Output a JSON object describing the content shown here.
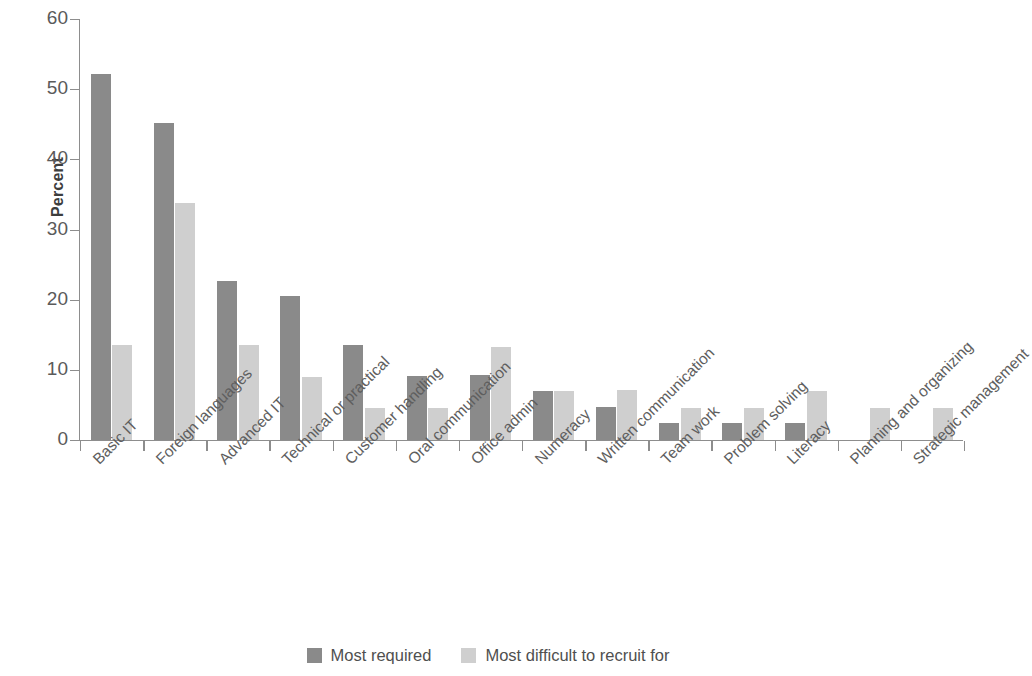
{
  "chart_data": {
    "type": "bar",
    "title": "",
    "subtitle": "",
    "xlabel": "",
    "ylabel": "Percent",
    "ylim": [
      0,
      60
    ],
    "yticks": [
      0,
      10,
      20,
      30,
      40,
      50,
      60
    ],
    "ytick_labels": [
      "0",
      "10",
      "20",
      "30",
      "40",
      "50",
      "60"
    ],
    "grid": false,
    "legend_position": "bottom-center",
    "orientation": "vertical",
    "bar_label_rotation": -45,
    "categories": [
      "Basic IT",
      "Foreign languages",
      "Advanced IT",
      "Technical or practical",
      "Customer handling",
      "Oral communication",
      "Office admin",
      "Numeracy",
      "Written communication",
      "Team work",
      "Problem solving",
      "Literacy",
      "Planning and organizing",
      "Strategic management"
    ],
    "series": [
      {
        "name": "Most required",
        "color": "#8a8a8a",
        "values": [
          52.2,
          45.2,
          22.6,
          20.5,
          13.6,
          9.1,
          9.2,
          7.0,
          4.7,
          2.4,
          2.4,
          2.4,
          0,
          0
        ]
      },
      {
        "name": "Most difficult to recruit for",
        "color": "#cfcfcf",
        "values": [
          13.5,
          33.8,
          13.5,
          9.0,
          4.5,
          4.5,
          13.3,
          7.0,
          7.1,
          4.6,
          4.6,
          7.0,
          4.6,
          4.6
        ]
      }
    ]
  },
  "legend": {
    "items": [
      {
        "label": "Most required",
        "swatch": "legend-swatch-dark"
      },
      {
        "label": "Most difficult to recruit for",
        "swatch": "legend-swatch-light"
      }
    ]
  }
}
